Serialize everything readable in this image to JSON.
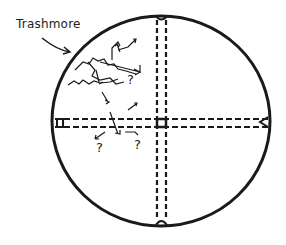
{
  "diagram": {
    "label": "Trashmore",
    "annotations": [
      "?",
      "?",
      "?"
    ],
    "colors": {
      "ink": "#1a1a1a",
      "background": "#ffffff"
    },
    "shapes": {
      "circle": {
        "cx": 161,
        "cy": 121,
        "rx": 109,
        "ry": 105
      },
      "vertical_dashed_lines_x": [
        157,
        166
      ],
      "horizontal_dashed_lines_y": [
        119,
        127
      ]
    }
  }
}
